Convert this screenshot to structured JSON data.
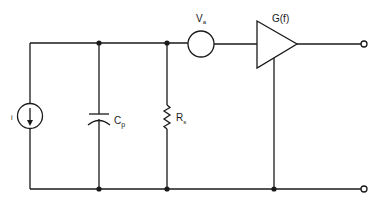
{
  "diagram": {
    "type": "circuit-schematic",
    "components": {
      "current_source": {
        "label": "i"
      },
      "capacitor": {
        "label": "C",
        "subscript": "p"
      },
      "resistor": {
        "label": "R",
        "subscript": "s"
      },
      "voltage_source": {
        "label": "V",
        "subscript": "a"
      },
      "amplifier": {
        "label": "G(f)"
      }
    },
    "terminals": [
      "output-top",
      "output-bottom"
    ],
    "colors": {
      "line": "#1a1a1a",
      "background": "#ffffff"
    }
  }
}
